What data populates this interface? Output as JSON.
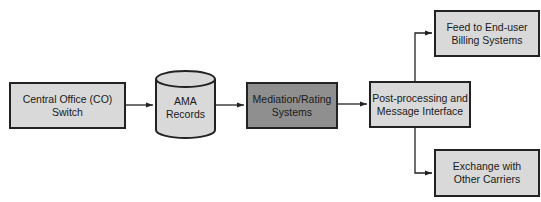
{
  "diagram": {
    "type": "flowchart",
    "colors": {
      "box_fill": "#d9d9d9",
      "highlight_fill": "#8f8f8f",
      "stroke": "#222222",
      "background": "#ffffff"
    },
    "nodes": {
      "co_switch": {
        "label": "Central Office (CO)\nSwitch",
        "shape": "rectangle"
      },
      "ama_records": {
        "label": "AMA\nRecords",
        "shape": "cylinder"
      },
      "mediation": {
        "label": "Mediation/Rating\nSystems",
        "shape": "rectangle"
      },
      "post_processing": {
        "label": "Post-processing and\nMessage Interface",
        "shape": "rectangle"
      },
      "billing_feed": {
        "label": "Feed to End-user\nBilling Systems",
        "shape": "rectangle"
      },
      "carrier_exchange": {
        "label": "Exchange with\nOther Carriers",
        "shape": "rectangle"
      }
    },
    "edges": [
      {
        "from": "co_switch",
        "to": "ama_records"
      },
      {
        "from": "ama_records",
        "to": "mediation"
      },
      {
        "from": "mediation",
        "to": "post_processing"
      },
      {
        "from": "post_processing",
        "to": "billing_feed"
      },
      {
        "from": "post_processing",
        "to": "carrier_exchange"
      }
    ]
  }
}
